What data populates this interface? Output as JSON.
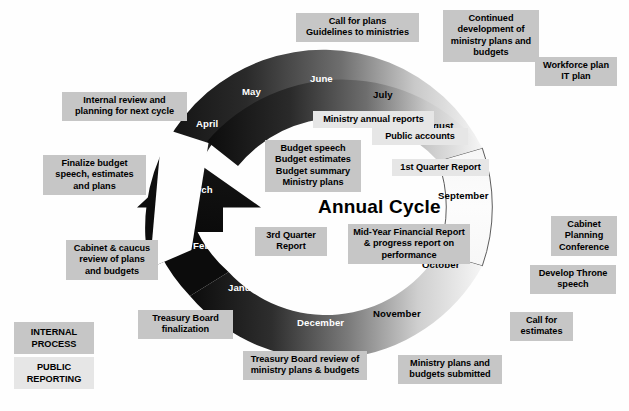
{
  "diagram": {
    "title": "Annual Cycle",
    "legend": [
      {
        "label": "INTERNAL\nPROCESS",
        "style": "internal",
        "name": "legend-internal-process"
      },
      {
        "label": "PUBLIC\nREPORTING",
        "style": "public",
        "name": "legend-public-reporting"
      }
    ],
    "colors": {
      "internal_process_fill": "#c6c6c6",
      "public_reporting_fill": "#e6e6e6",
      "ring_dark": "#111111",
      "ring_light": "#fbfbfb",
      "text": "#000000",
      "month_on_dark": "#ffffff",
      "background": "#fefefe"
    },
    "months": [
      {
        "label": "April",
        "x": 196,
        "y": 118,
        "tone": "onDark"
      },
      {
        "label": "May",
        "x": 242,
        "y": 86,
        "tone": "onDark"
      },
      {
        "label": "June",
        "x": 310,
        "y": 73,
        "tone": "onDark"
      },
      {
        "label": "July",
        "x": 373,
        "y": 89,
        "tone": "onLight"
      },
      {
        "label": "August",
        "x": 420,
        "y": 120,
        "tone": "onLight"
      },
      {
        "label": "September",
        "x": 438,
        "y": 190,
        "tone": "onLight"
      },
      {
        "label": "October",
        "x": 422,
        "y": 259,
        "tone": "onLight"
      },
      {
        "label": "November",
        "x": 373,
        "y": 308,
        "tone": "onLight"
      },
      {
        "label": "December",
        "x": 297,
        "y": 317,
        "tone": "onDark"
      },
      {
        "label": "January",
        "x": 228,
        "y": 282,
        "tone": "onDark"
      },
      {
        "label": "February",
        "x": 193,
        "y": 240,
        "tone": "onDark"
      },
      {
        "label": "March",
        "x": 184,
        "y": 184,
        "tone": "onDark"
      }
    ],
    "boxes": [
      {
        "text": "Call for plans\nGuidelines to ministries",
        "style": "internal",
        "x": 296,
        "y": 13,
        "w": 123,
        "name": "box-call-for-plans"
      },
      {
        "text": "Continued\ndevelopment of\nministry plans and\nbudgets",
        "style": "internal",
        "x": 443,
        "y": 10,
        "w": 96,
        "name": "box-continued-development"
      },
      {
        "text": "Workforce plan\nIT plan",
        "style": "internal",
        "x": 535,
        "y": 57,
        "w": 82,
        "name": "box-workforce-it-plan"
      },
      {
        "text": "Internal review and\nplanning for next cycle",
        "style": "internal",
        "x": 62,
        "y": 92,
        "w": 125,
        "name": "box-internal-review"
      },
      {
        "text": "Ministry annual reports",
        "style": "public",
        "x": 313,
        "y": 111,
        "w": 121,
        "name": "box-ministry-annual-reports"
      },
      {
        "text": "Public accounts",
        "style": "public",
        "x": 372,
        "y": 128,
        "w": 96,
        "name": "box-public-accounts"
      },
      {
        "text": "Budget speech\nBudget estimates\nBudget summary\nMinistry plans",
        "style": "internal",
        "x": 265,
        "y": 140,
        "w": 96,
        "name": "box-budget-documents"
      },
      {
        "text": "1st Quarter Report",
        "style": "public",
        "x": 392,
        "y": 159,
        "w": 97,
        "name": "box-1st-quarter-report"
      },
      {
        "text": "Finalize budget\nspeech, estimates\nand plans",
        "style": "internal",
        "x": 43,
        "y": 155,
        "w": 103,
        "name": "box-finalize-budget"
      },
      {
        "text": "Cabinet\nPlanning\nConference",
        "style": "internal",
        "x": 551,
        "y": 216,
        "w": 66,
        "name": "box-cabinet-planning-conference"
      },
      {
        "text": "3rd Quarter\nReport",
        "style": "internal",
        "x": 255,
        "y": 227,
        "w": 72,
        "name": "box-3rd-quarter-report"
      },
      {
        "text": "Mid-Year Financial Report\n& progress report on\nperformance",
        "style": "internal",
        "x": 348,
        "y": 224,
        "w": 122,
        "name": "box-mid-year-financial-report"
      },
      {
        "text": "Develop Throne\nspeech",
        "style": "internal",
        "x": 530,
        "y": 265,
        "w": 86,
        "name": "box-develop-throne-speech"
      },
      {
        "text": "Cabinet & caucus\nreview of plans\nand budgets",
        "style": "internal",
        "x": 66,
        "y": 240,
        "w": 92,
        "name": "box-cabinet-caucus-review"
      },
      {
        "text": "Treasury Board\nfinalization",
        "style": "internal",
        "x": 138,
        "y": 310,
        "w": 95,
        "name": "box-treasury-board-finalization"
      },
      {
        "text": "Call for\nestimates",
        "style": "internal",
        "x": 510,
        "y": 312,
        "w": 63,
        "name": "box-call-for-estimates"
      },
      {
        "text": "Treasury Board review of\nministry plans & budgets",
        "style": "internal",
        "x": 243,
        "y": 351,
        "w": 124,
        "name": "box-treasury-board-review"
      },
      {
        "text": "Ministry plans and\nbudgets submitted",
        "style": "internal",
        "x": 398,
        "y": 355,
        "w": 104,
        "name": "box-ministry-plans-submitted"
      }
    ]
  }
}
